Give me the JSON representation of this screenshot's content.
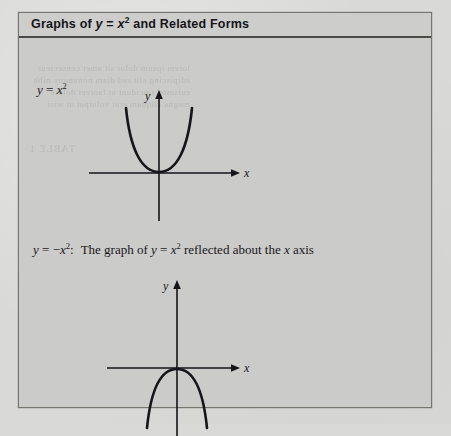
{
  "page": {
    "background_color": "#d9d9d7",
    "box_background_color": "#cbcbc9",
    "ink_color": "#15151a"
  },
  "figure_box": {
    "header": {
      "title_prefix": "Graphs of ",
      "title_var_y": "y",
      "title_equals": " = ",
      "title_var_x": "x",
      "title_exponent": "2",
      "title_suffix": " and Related Forms",
      "title_plain": "Graphs of y = x2 and Related Forms"
    }
  },
  "captions": {
    "first": {
      "var_y": "y",
      "equals": " = ",
      "var_x": "x",
      "exponent": "2",
      "plain": "y = x2"
    },
    "second": {
      "var_y": "y",
      "equals": " = ",
      "minus": "−",
      "var_x": "x",
      "exponent": "2",
      "colon": ":",
      "text_part_1": "The graph of ",
      "var_y2": "y",
      "equals2": " = ",
      "var_x2": "x",
      "exponent2": "2",
      "text_part_2": " reflected about the ",
      "var_x3": "x",
      "text_part_3": " axis",
      "plain": "y = −x2:  The graph of y = x2 reflected about the x axis"
    }
  },
  "graphs": [
    {
      "name": "parabola-upward",
      "equation": "y = x2",
      "x_axis_label": "x",
      "y_axis_label": "y",
      "opens": "up",
      "vertex": [
        0,
        0
      ]
    },
    {
      "name": "parabola-downward",
      "equation": "y = -x2",
      "x_axis_label": "x",
      "y_axis_label": "y",
      "opens": "down",
      "vertex": [
        0,
        0
      ]
    }
  ],
  "bleed_through": {
    "line_1": "reverse page show-through",
    "line_2": "TABLE 1"
  }
}
